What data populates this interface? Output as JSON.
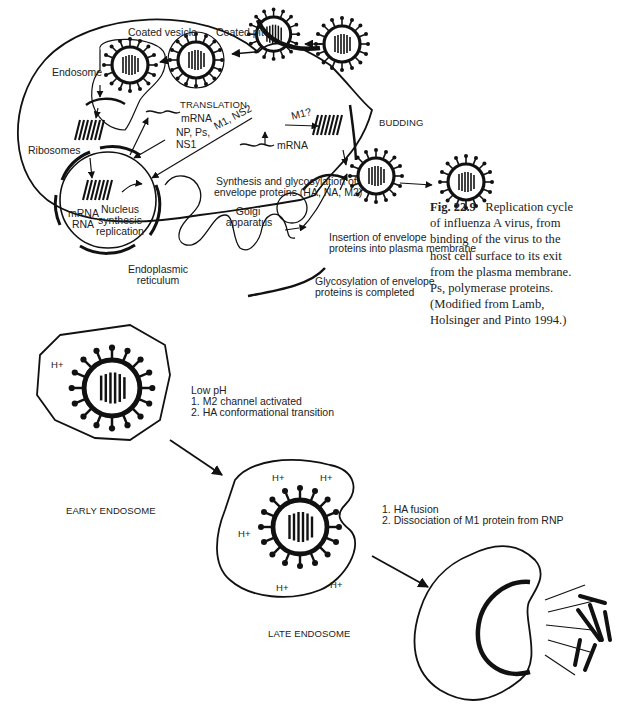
{
  "figure_top": {
    "labels": {
      "coated_vesicle": "Coated vesicle",
      "coated_pit": "Coated pit",
      "endosome": "Endosome",
      "translation": "TRANSLATION",
      "mrna_1": "mRNA",
      "np_ps": "NP, Ps,",
      "ns1": "NS1",
      "m1_ns2": "M1, NS2",
      "m1q": "M1?",
      "mrna_2": "mRNA",
      "budding": "BUDDING",
      "ribosomes": "Ribosomes",
      "nucleus_left_1": "mRNA",
      "nucleus_left_2": "RNA",
      "nucleus_right_1": "Nucleus",
      "nucleus_right_2": "synthesis",
      "nucleus_right_3": "replication",
      "synthesis_1": "Synthesis and glycosylation of",
      "synthesis_2": "envelope proteins (HA, NA, M2)",
      "golgi_1": "Golgi",
      "golgi_2": "apparatus",
      "er_1": "Endoplasmic",
      "er_2": "reticulum",
      "insertion_1": "Insertion of envelope",
      "insertion_2": "proteins into plasma membrane",
      "glyco_1": "Glycosylation of envelope",
      "glyco_2": "proteins is completed"
    },
    "caption": {
      "fig_number": "Fig. 22.9",
      "lines": [
        "Replication cycle",
        "of influenza A virus, from",
        "binding of the virus to the",
        "host cell surface to its exit",
        "from the plasma membrane.",
        "Ps, polymerase proteins.",
        "(Modified from Lamb,",
        "Holsinger and Pinto 1994.)"
      ]
    }
  },
  "figure_bottom": {
    "early_endosome": {
      "label": "EARLY ENDOSOME",
      "hplus": "H+",
      "steps_title": "Low pH",
      "steps": [
        "1. M2 channel activated",
        "2. HA conformational transition"
      ]
    },
    "late_endosome": {
      "label": "LATE ENDOSOME",
      "hplus": "H+",
      "steps": [
        "1. HA fusion",
        "2. Dissociation of M1 protein from RNP"
      ]
    }
  },
  "colors": {
    "ink": "#111111",
    "text": "#222222",
    "background": "#ffffff"
  }
}
